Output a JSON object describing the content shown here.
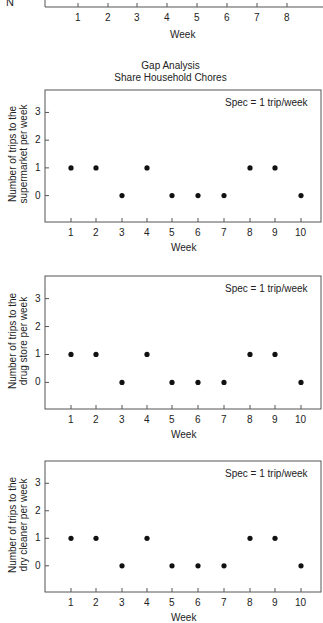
{
  "top_partial_chart": {
    "ylabel_fragment": "N",
    "x_ticks": [
      "1",
      "2",
      "3",
      "4",
      "5",
      "6",
      "7",
      "8"
    ],
    "xlabel": "Week"
  },
  "header": {
    "title": "Gap Analysis",
    "subtitle": "Share Household Chores"
  },
  "chart_data": [
    {
      "type": "scatter",
      "title": "Gap Analysis - Share Household Chores",
      "xlabel": "Week",
      "ylabel": "Number of trips to the supermarket per week",
      "ylabel_lines": [
        "Number of trips to the",
        "supermarket per week"
      ],
      "annotation": "Spec = 1 trip/week",
      "x": [
        1,
        2,
        3,
        4,
        5,
        6,
        7,
        8,
        9,
        10
      ],
      "y": [
        1,
        1,
        0,
        1,
        0,
        0,
        0,
        1,
        1,
        0
      ],
      "x_ticks": [
        "1",
        "2",
        "3",
        "4",
        "5",
        "6",
        "7",
        "8",
        "9",
        "10"
      ],
      "y_ticks": [
        "0",
        "1",
        "2",
        "3"
      ],
      "xlim": [
        0.3,
        10.8
      ],
      "ylim": [
        -0.9,
        3.8
      ],
      "grid": false
    },
    {
      "type": "scatter",
      "xlabel": "Week",
      "ylabel": "Number of trips to the drug store per week",
      "ylabel_lines": [
        "Number of trips to the",
        "drug store per  week"
      ],
      "annotation": "Spec = 1 trip/week",
      "x": [
        1,
        2,
        3,
        4,
        5,
        6,
        7,
        8,
        9,
        10
      ],
      "y": [
        1,
        1,
        0,
        1,
        0,
        0,
        0,
        1,
        1,
        0
      ],
      "x_ticks": [
        "1",
        "2",
        "3",
        "4",
        "5",
        "6",
        "7",
        "8",
        "9",
        "10"
      ],
      "y_ticks": [
        "0",
        "1",
        "2",
        "3"
      ],
      "xlim": [
        0.3,
        10.8
      ],
      "ylim": [
        -0.9,
        3.8
      ],
      "grid": false
    },
    {
      "type": "scatter",
      "xlabel": "Week",
      "ylabel": "Number of trips to the dry cleaner per week",
      "ylabel_lines": [
        "Number of trips to the",
        "dry cleaner per  week"
      ],
      "annotation": "Spec = 1 trip/week",
      "x": [
        1,
        2,
        3,
        4,
        5,
        6,
        7,
        8,
        9,
        10
      ],
      "y": [
        1,
        1,
        0,
        1,
        0,
        0,
        0,
        1,
        1,
        0
      ],
      "x_ticks": [
        "1",
        "2",
        "3",
        "4",
        "5",
        "6",
        "7",
        "8",
        "9",
        "10"
      ],
      "y_ticks": [
        "0",
        "1",
        "2",
        "3"
      ],
      "xlim": [
        0.3,
        10.8
      ],
      "ylim": [
        -0.9,
        3.8
      ],
      "grid": false
    }
  ]
}
